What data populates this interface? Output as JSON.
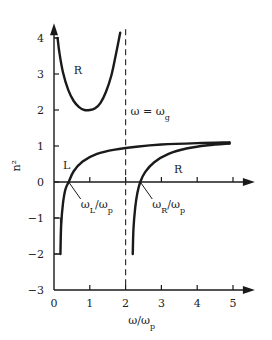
{
  "chart_data": {
    "type": "line",
    "title": "",
    "xlabel": "ω/ω_p",
    "ylabel": "n²",
    "xlim": [
      0,
      5.5
    ],
    "ylim": [
      -3,
      4.3
    ],
    "xticks": [
      0,
      1,
      2,
      3,
      4,
      5
    ],
    "xtick_labels": [
      "0",
      "1",
      "2",
      "3",
      "4",
      "5"
    ],
    "yticks": [
      -3,
      -2,
      -1,
      0,
      1,
      2,
      3,
      4
    ],
    "ytick_labels": [
      "−3",
      "−2",
      "−1",
      "0",
      "1",
      "2",
      "3",
      "4"
    ],
    "grid": false,
    "vertical_line": {
      "x": 2,
      "label_main": "ω = ω",
      "label_sub": "g"
    },
    "series": [
      {
        "name": "R (lower branch)",
        "label": "R",
        "points": [
          [
            0.1,
            4.0
          ],
          [
            0.15,
            3.6
          ],
          [
            0.25,
            3.05
          ],
          [
            0.4,
            2.55
          ],
          [
            0.55,
            2.25
          ],
          [
            0.7,
            2.08
          ],
          [
            0.85,
            2.0
          ],
          [
            1.0,
            2.0
          ],
          [
            1.15,
            2.05
          ],
          [
            1.3,
            2.2
          ],
          [
            1.45,
            2.5
          ],
          [
            1.6,
            2.95
          ],
          [
            1.72,
            3.5
          ],
          [
            1.85,
            4.15
          ]
        ]
      },
      {
        "name": "L",
        "label": "L",
        "points": [
          [
            0.18,
            -2.0
          ],
          [
            0.2,
            -1.2
          ],
          [
            0.25,
            -0.6
          ],
          [
            0.32,
            -0.2
          ],
          [
            0.41,
            0.0
          ],
          [
            0.55,
            0.3
          ],
          [
            0.8,
            0.57
          ],
          [
            1.2,
            0.78
          ],
          [
            1.7,
            0.9
          ],
          [
            2.3,
            0.98
          ],
          [
            3.0,
            1.04
          ],
          [
            4.0,
            1.08
          ],
          [
            4.9,
            1.1
          ]
        ]
      },
      {
        "name": "R (upper branch)",
        "label": "R",
        "points": [
          [
            2.2,
            -2.0
          ],
          [
            2.22,
            -1.3
          ],
          [
            2.27,
            -0.7
          ],
          [
            2.33,
            -0.3
          ],
          [
            2.41,
            0.0
          ],
          [
            2.55,
            0.28
          ],
          [
            2.8,
            0.55
          ],
          [
            3.2,
            0.78
          ],
          [
            3.7,
            0.93
          ],
          [
            4.3,
            1.02
          ],
          [
            4.9,
            1.07
          ]
        ]
      }
    ],
    "annotations": [
      {
        "text": "R",
        "x": 0.55,
        "y": 3.0
      },
      {
        "text": "L",
        "x": 0.25,
        "y": 0.35
      },
      {
        "text": "R",
        "x": 3.35,
        "y": 0.25
      },
      {
        "text_main": "ω",
        "text_sub": "L",
        "text_tail": "/ω",
        "text_sub2": "p",
        "points_to": [
          0.41,
          0.0
        ]
      },
      {
        "text_main": "ω",
        "text_sub": "R",
        "text_tail": "/ω",
        "text_sub2": "p",
        "points_to": [
          2.41,
          0.0
        ]
      }
    ],
    "lower_left_marker": {
      "x_from": 0,
      "x_to": 0.18,
      "y_range": [
        -2,
        -1
      ]
    },
    "upper_left_marker": {
      "x_from": 0,
      "x_to": 0.1,
      "y": 4.0
    }
  }
}
